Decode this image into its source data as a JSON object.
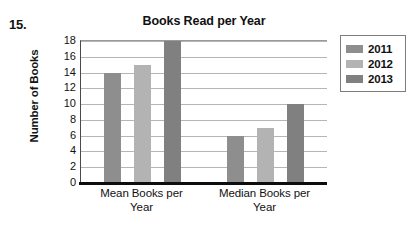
{
  "question_number": "15.",
  "chart_data": {
    "type": "bar",
    "title": "Books Read per Year",
    "xlabel": "",
    "ylabel": "Number of Books",
    "categories": [
      "Mean Books per Year",
      "Median Books per Year"
    ],
    "series": [
      {
        "name": "2011",
        "values": [
          14,
          6
        ],
        "color": "#8e8e8e"
      },
      {
        "name": "2012",
        "values": [
          15,
          7
        ],
        "color": "#b3b3b3"
      },
      {
        "name": "2013",
        "values": [
          18,
          10
        ],
        "color": "#808080"
      }
    ],
    "ylim": [
      0,
      18
    ],
    "yticks": [
      0,
      2,
      4,
      6,
      8,
      10,
      12,
      14,
      16,
      18
    ],
    "ytick_labels": [
      "0",
      "2",
      "4",
      "6",
      "8",
      "10",
      "12",
      "14",
      "16",
      "18"
    ],
    "grid": true,
    "legend_position": "right",
    "legend_entries": [
      "2011",
      "2012",
      "2013"
    ]
  },
  "xlabels": [
    {
      "line1": "Mean Books per",
      "line2": "Year"
    },
    {
      "line1": "Median Books per",
      "line2": "Year"
    }
  ],
  "colors": {
    "series_2011": "#8e8e8e",
    "series_2012": "#b3b3b3",
    "series_2013": "#808080",
    "gridline": "#b5b5b5",
    "axis": "#0d0d0d",
    "background": "#ffffff"
  }
}
